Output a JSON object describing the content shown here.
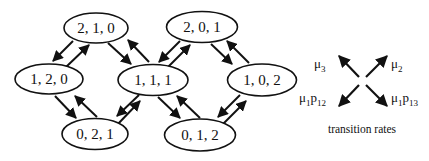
{
  "diagram": {
    "type": "state-transition-graph",
    "nodes": [
      {
        "id": "n210",
        "label": "2, 1, 0",
        "cx": 96,
        "cy": 28
      },
      {
        "id": "n120",
        "label": "1, 2, 0",
        "cx": 49,
        "cy": 79
      },
      {
        "id": "n021",
        "label": "0, 2, 1",
        "cx": 95,
        "cy": 134
      },
      {
        "id": "n111",
        "label": "1, 1, 1",
        "cx": 153,
        "cy": 80
      },
      {
        "id": "n201",
        "label": "2, 0, 1",
        "cx": 202,
        "cy": 27
      },
      {
        "id": "n102",
        "label": "1, 0, 2",
        "cx": 262,
        "cy": 80
      },
      {
        "id": "n012",
        "label": "0, 1, 2",
        "cx": 200,
        "cy": 135
      }
    ],
    "edges": [
      {
        "from": "2, 1, 0",
        "to": "1, 2, 0"
      },
      {
        "from": "1, 2, 0",
        "to": "2, 1, 0"
      },
      {
        "from": "2, 1, 0",
        "to": "1, 1, 1"
      },
      {
        "from": "1, 1, 1",
        "to": "2, 1, 0"
      },
      {
        "from": "1, 2, 0",
        "to": "0, 2, 1"
      },
      {
        "from": "0, 2, 1",
        "to": "1, 2, 0"
      },
      {
        "from": "1, 1, 1",
        "to": "0, 2, 1"
      },
      {
        "from": "0, 2, 1",
        "to": "1, 1, 1"
      },
      {
        "from": "2, 0, 1",
        "to": "1, 1, 1"
      },
      {
        "from": "1, 1, 1",
        "to": "2, 0, 1"
      },
      {
        "from": "2, 0, 1",
        "to": "1, 0, 2"
      },
      {
        "from": "1, 0, 2",
        "to": "2, 0, 1"
      },
      {
        "from": "1, 1, 1",
        "to": "0, 1, 2"
      },
      {
        "from": "0, 1, 2",
        "to": "1, 1, 1"
      },
      {
        "from": "1, 0, 2",
        "to": "0, 1, 2"
      },
      {
        "from": "0, 1, 2",
        "to": "1, 0, 2"
      }
    ]
  },
  "legend": {
    "title": "transition rates",
    "arrows": [
      {
        "direction": "up-left",
        "label_main": "μ",
        "label_sub": "3",
        "label_extra": "",
        "label_extra_sub": ""
      },
      {
        "direction": "up-right",
        "label_main": "μ",
        "label_sub": "2",
        "label_extra": "",
        "label_extra_sub": ""
      },
      {
        "direction": "down-left",
        "label_main": "μ",
        "label_sub": "1",
        "label_extra": "p",
        "label_extra_sub": "12"
      },
      {
        "direction": "down-right",
        "label_main": "μ",
        "label_sub": "1",
        "label_extra": "p",
        "label_extra_sub": "13"
      }
    ]
  },
  "colors": {
    "stroke": "#111111",
    "background": "#ffffff"
  }
}
